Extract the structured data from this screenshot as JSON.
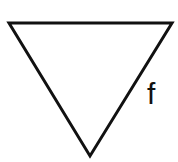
{
  "diagram": {
    "shape": "inverted-triangle",
    "vertices": [
      [
        9,
        23
      ],
      [
        172,
        23
      ],
      [
        90,
        156
      ]
    ],
    "stroke_color": "#111111",
    "fill_color": "#ffffff",
    "stroke_width": 3,
    "side_label": {
      "text": "f",
      "x": 147,
      "y": 79
    }
  }
}
